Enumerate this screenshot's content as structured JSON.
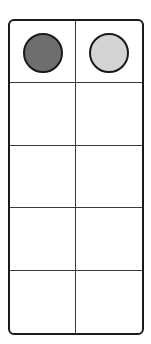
{
  "ten_frame": {
    "rows": 5,
    "columns": 2,
    "colors": {
      "border": "#1a1a1a",
      "grid_line": "#3a3a3a",
      "background": "#ffffff"
    },
    "counters": [
      {
        "row": 0,
        "col": 0,
        "name": "dark-counter",
        "color": "#6e6e6e"
      },
      {
        "row": 0,
        "col": 1,
        "name": "light-counter",
        "color": "#d4d4d4"
      }
    ]
  }
}
